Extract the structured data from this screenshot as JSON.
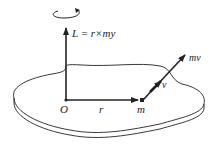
{
  "diagram": {
    "labels": {
      "angular_momentum": "L = r×my",
      "origin": "O",
      "position": "r",
      "mass": "m",
      "velocity": "v",
      "momentum": "mv"
    },
    "icons": {
      "rotation": "rotation-arrow-icon"
    },
    "colors": {
      "ink": "#222222",
      "background": "#ffffff"
    }
  }
}
